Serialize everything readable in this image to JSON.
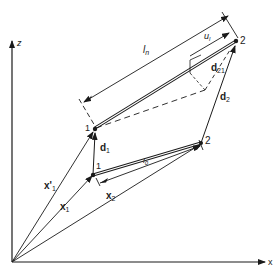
{
  "diagram": {
    "colors": {
      "ink": "#1a1a1a",
      "background": "#ffffff"
    },
    "axes": {
      "z_label": "z",
      "x_label": "x"
    },
    "nodes": {
      "deformed_1": "1",
      "deformed_2": "2",
      "original_1": "1",
      "original_2": "2"
    },
    "labels": {
      "deformed_length": "l",
      "deformed_length_sub": "n",
      "displacement": "u",
      "displacement_sub": "l",
      "d21": "d",
      "d21_sub": "21",
      "d1": "d",
      "d1_sub": "1",
      "d2": "d",
      "d2_sub": "2",
      "original_length": "l",
      "original_length_sub": "0",
      "x1_prime": "x'",
      "x1_prime_sub": "1",
      "x1": "x",
      "x1_sub": "1",
      "x2": "x",
      "x2_sub": "2"
    }
  }
}
